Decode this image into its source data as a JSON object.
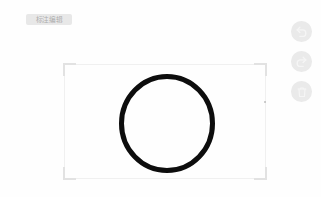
{
  "app": {
    "name": "image-annotation-editor",
    "background_color": "#ffffff",
    "canvas_color": "#fefefe"
  },
  "label_chip": {
    "text": "标注编辑",
    "background_color": "#c8c8c8",
    "text_color": "#969696"
  },
  "crop_frame": {
    "edge_color": "#f0f0f0",
    "corner_color": "#e2e2e2",
    "left": 64,
    "top": 64,
    "width": 202,
    "height": 115
  },
  "drawing": {
    "shape": "circle",
    "stroke_color": "#0d0d0d",
    "stroke_width": 5,
    "center_x": 167,
    "center_y": 123,
    "radius_x": 45,
    "radius_y": 47
  },
  "toolbar": {
    "buttons": [
      {
        "name": "undo-button",
        "icon": "undo-arrow-icon",
        "label": "撤销"
      },
      {
        "name": "redo-button",
        "icon": "redo-arrow-icon",
        "label": "重做"
      },
      {
        "name": "delete-button",
        "icon": "trash-can-icon",
        "label": "删除"
      }
    ],
    "button_background": "#d6d6d6",
    "icon_color": "#ffffff"
  },
  "point_marker": {
    "visible": true,
    "color": "#969696"
  }
}
